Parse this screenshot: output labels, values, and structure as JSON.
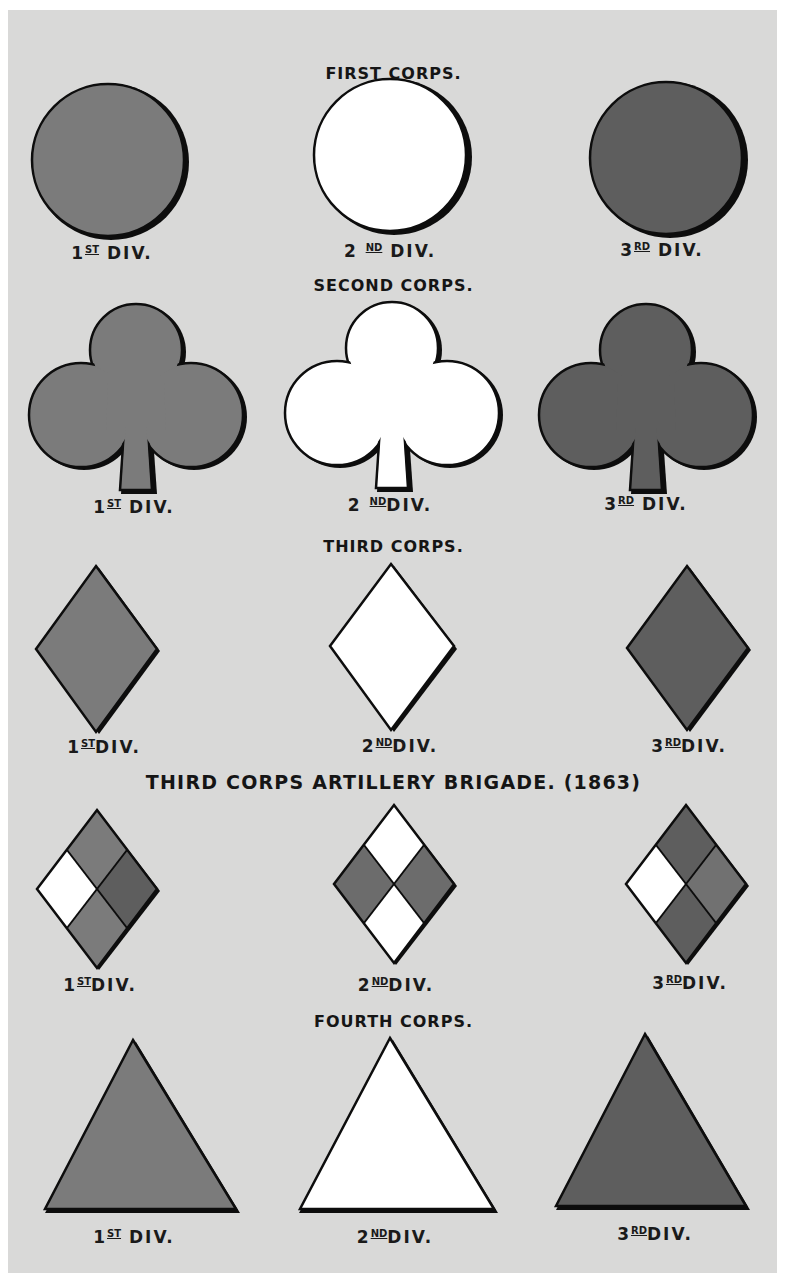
{
  "colors": {
    "background": "#d9d9d8",
    "first_division": "#7b7b7b",
    "second_division": "#ffffff",
    "third_division": "#5e5e5e",
    "outline": "#0d0d0d"
  },
  "sections": [
    {
      "title": "FIRST CORPS.",
      "shape": "circle-icon",
      "divisions": [
        {
          "num": "1",
          "suffix": "ST",
          "text": "DIV.",
          "color": "medium-gray"
        },
        {
          "num": "2",
          "suffix": "ND",
          "text": "DIV.",
          "color": "white"
        },
        {
          "num": "3",
          "suffix": "RD",
          "text": "DIV.",
          "color": "dark-gray"
        }
      ]
    },
    {
      "title": "SECOND CORPS.",
      "shape": "trefoil-icon",
      "divisions": [
        {
          "num": "1",
          "suffix": "ST",
          "text": "DIV.",
          "color": "medium-gray"
        },
        {
          "num": "2",
          "suffix": "ND",
          "text": "DIV.",
          "color": "white"
        },
        {
          "num": "3",
          "suffix": "RD",
          "text": "DIV.",
          "color": "dark-gray"
        }
      ]
    },
    {
      "title": "THIRD CORPS.",
      "shape": "diamond-icon",
      "divisions": [
        {
          "num": "1",
          "suffix": "ST",
          "text": "DIV.",
          "color": "medium-gray"
        },
        {
          "num": "2",
          "suffix": "ND",
          "text": "DIV.",
          "color": "white"
        },
        {
          "num": "3",
          "suffix": "RD",
          "text": "DIV.",
          "color": "dark-gray"
        }
      ]
    },
    {
      "title": "THIRD CORPS ARTILLERY BRIGADE. (1863)",
      "shape": "quartered-diamond-icon",
      "divisions": [
        {
          "num": "1",
          "suffix": "ST",
          "text": "DIV.",
          "quadrants": {
            "top": "medium-gray",
            "right": "dark-gray",
            "bottom": "medium-gray",
            "left": "white"
          }
        },
        {
          "num": "2",
          "suffix": "ND",
          "text": "DIV.",
          "quadrants": {
            "top": "white",
            "right": "medium-gray",
            "bottom": "white",
            "left": "medium-gray"
          }
        },
        {
          "num": "3",
          "suffix": "RD",
          "text": "DIV.",
          "quadrants": {
            "top": "dark-gray",
            "right": "medium-gray",
            "bottom": "dark-gray",
            "left": "white"
          }
        }
      ]
    },
    {
      "title": "FOURTH CORPS.",
      "shape": "triangle-icon",
      "divisions": [
        {
          "num": "1",
          "suffix": "ST",
          "text": "DIV.",
          "color": "medium-gray"
        },
        {
          "num": "2",
          "suffix": "ND",
          "text": "DIV.",
          "color": "white"
        },
        {
          "num": "3",
          "suffix": "RD",
          "text": "DIV.",
          "color": "dark-gray"
        }
      ]
    }
  ]
}
